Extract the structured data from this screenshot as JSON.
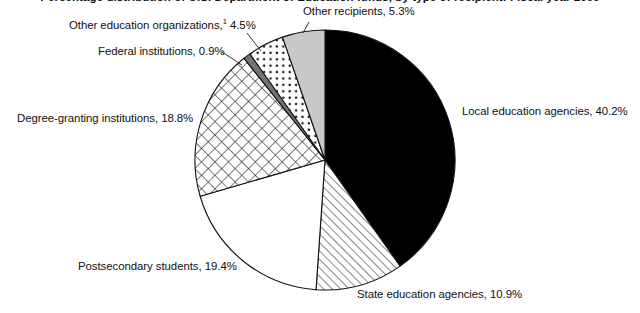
{
  "chart_data": {
    "type": "pie",
    "title": "Percentage distribution of U.S. Department of Education funds, by type of recipient: Fiscal year 2009",
    "subtitle": "",
    "xlabel": "",
    "ylabel": "",
    "legend_position": "none",
    "grid": false,
    "units": "percent",
    "start_angle_deg": 0,
    "direction": "clockwise",
    "categories": [
      "Local education agencies",
      "State education agencies",
      "Postsecondary students",
      "Degree-granting institutions",
      "Federal institutions",
      "Other education organizations",
      "Other recipients"
    ],
    "values": [
      40.2,
      10.9,
      19.4,
      18.8,
      0.9,
      4.5,
      5.3
    ],
    "slices": [
      {
        "key": "local-education-agencies",
        "label": "Local education agencies, 40.2%",
        "name": "Local education agencies",
        "value": 40.2,
        "fill": "solid-black",
        "color": "#000000",
        "footnote": ""
      },
      {
        "key": "state-education-agencies",
        "label": "State education agencies, 10.9%",
        "name": "State education agencies",
        "value": 10.9,
        "fill": "diagonal-hatch",
        "color": "#ffffff",
        "footnote": ""
      },
      {
        "key": "postsecondary-students",
        "label": "Postsecondary students, 19.4%",
        "name": "Postsecondary students",
        "value": 19.4,
        "fill": "blank-white",
        "color": "#ffffff",
        "footnote": ""
      },
      {
        "key": "degree-granting-institutions",
        "label": "Degree-granting institutions, 18.8%",
        "name": "Degree-granting institutions",
        "value": 18.8,
        "fill": "cross-hatch",
        "color": "#ffffff",
        "footnote": ""
      },
      {
        "key": "federal-institutions",
        "label": "Federal institutions, 0.9%",
        "name": "Federal institutions",
        "value": 0.9,
        "fill": "solid-dark-gray",
        "color": "#737373",
        "footnote": ""
      },
      {
        "key": "other-education-organizations",
        "label": "Other education organizations,",
        "label_suffix": " 4.5%",
        "name": "Other education organizations",
        "value": 4.5,
        "fill": "dotted",
        "color": "#ffffff",
        "footnote": "1"
      },
      {
        "key": "other-recipients",
        "label": "Other recipients, 5.3%",
        "name": "Other recipients",
        "value": 5.3,
        "fill": "solid-light-gray",
        "color": "#c8c8c8",
        "footnote": ""
      }
    ]
  },
  "labels": {
    "other_education_organizations": "Other education organizations,",
    "other_education_organizations_footnote": "1",
    "other_education_organizations_value": " 4.5%",
    "federal_institutions": "Federal institutions, 0.9%",
    "degree_granting_institutions": "Degree-granting institutions, 18.8%",
    "postsecondary_students": "Postsecondary students, 19.4%",
    "state_education_agencies": "State education agencies, 10.9%",
    "local_education_agencies": "Local education agencies, 40.2%",
    "other_recipients": "Other recipients, 5.3%"
  }
}
